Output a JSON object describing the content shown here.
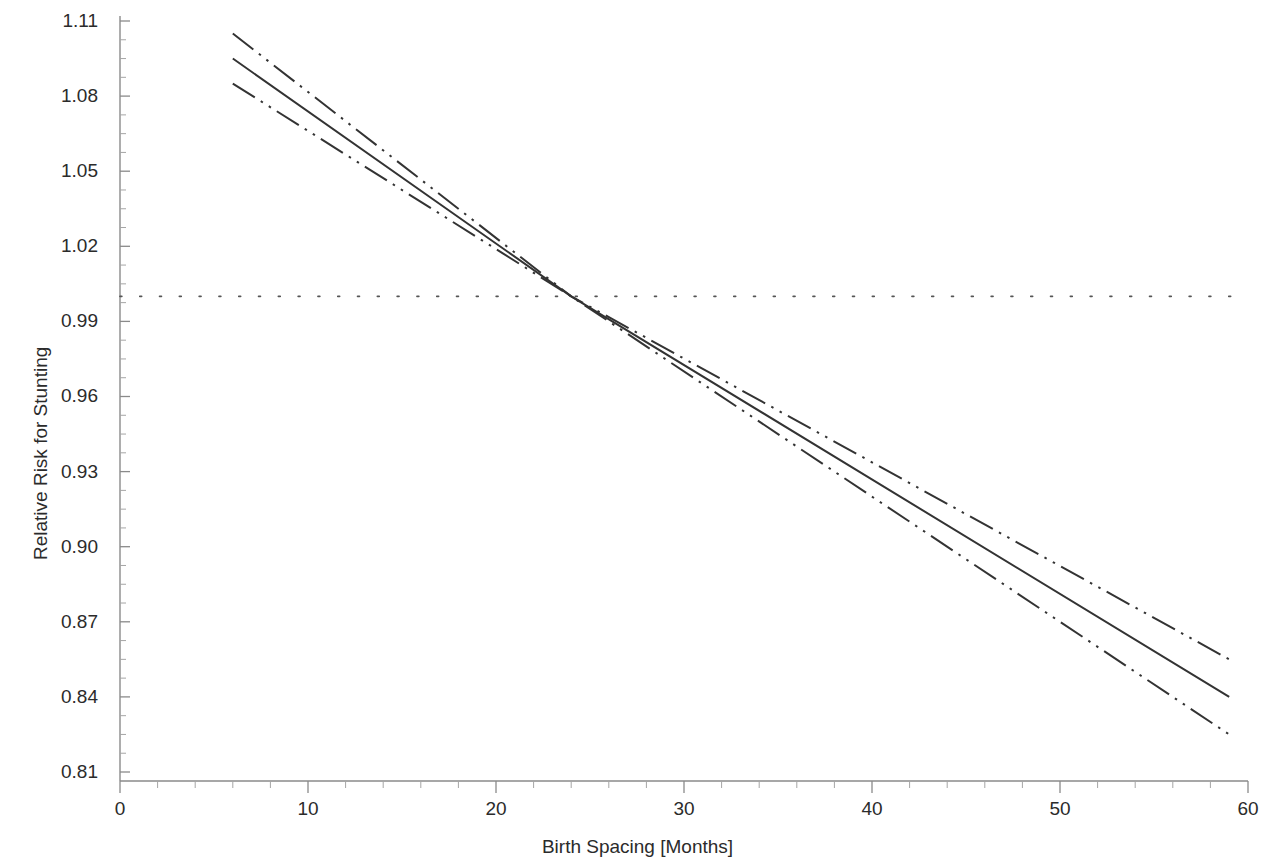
{
  "chart_data": {
    "type": "line",
    "title": "",
    "xlabel": "Birth Spacing [Months]",
    "ylabel": "Relative Risk for Stunting",
    "xlim": [
      0,
      60
    ],
    "ylim": [
      0.81,
      1.11
    ],
    "xticks": [
      "0",
      "10",
      "20",
      "30",
      "40",
      "50",
      "60"
    ],
    "xtick_values": [
      0,
      10,
      20,
      30,
      40,
      50,
      60
    ],
    "yticks": [
      "1.11",
      "1.08",
      "1.05",
      "1.02",
      "0.99",
      "0.96",
      "0.93",
      "0.90",
      "0.87",
      "0.84",
      "0.81"
    ],
    "ytick_values": [
      1.11,
      1.08,
      1.05,
      1.02,
      0.99,
      0.96,
      0.93,
      0.9,
      0.87,
      0.84,
      0.81
    ],
    "grid": false,
    "legend": null,
    "x_minor_tick_interval": 2,
    "y_minor_tick_interval": 0.0075,
    "series": [
      {
        "name": "Relative Risk (point estimate)",
        "style": "solid",
        "color": "#333333",
        "x": [
          6,
          24,
          59
        ],
        "values": [
          1.095,
          1.0,
          0.84
        ]
      },
      {
        "name": "Upper 95% confidence limit",
        "style": "dash-dot-dot",
        "color": "#333333",
        "x": [
          6,
          24,
          59
        ],
        "values": [
          1.105,
          1.0,
          0.855
        ]
      },
      {
        "name": "Lower 95% confidence limit",
        "style": "dash-dot-dot",
        "color": "#333333",
        "x": [
          6,
          24,
          59
        ],
        "values": [
          1.085,
          1.0,
          0.825
        ]
      }
    ],
    "reference_line": {
      "name": "Null relative risk",
      "orientation": "horizontal",
      "value": 1.0,
      "style": "dotted",
      "color": "#555555"
    }
  }
}
